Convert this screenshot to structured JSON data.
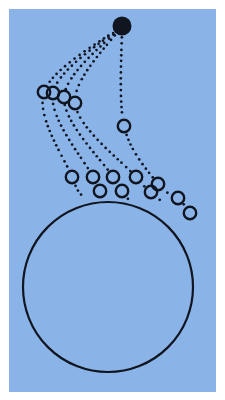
{
  "figure": {
    "type": "diagram",
    "canvas": {
      "width": 225,
      "height": 400
    },
    "background": {
      "page_color": "#ffffff",
      "field_color": "#8ab4e8",
      "field_rect": {
        "x": 9,
        "y": 9,
        "width": 207,
        "height": 383
      }
    },
    "ink_color": "#10151f",
    "launch_point": {
      "label": "launch-point",
      "cx": 122,
      "cy": 26,
      "r": 9.5,
      "fill": "#10151f",
      "filled": true
    },
    "planet": {
      "label": "planet-circle",
      "cx": 108,
      "cy": 287,
      "r": 85,
      "stroke_width": 2.2,
      "fill": "none"
    },
    "marker_style": {
      "r": 6.2,
      "stroke_width": 2.4,
      "fill": "none"
    },
    "dotted_style": {
      "dot_radius": 1.35,
      "spacing": 5.0
    },
    "trajectories": [
      {
        "name": "trajectory-1",
        "description": "shortest range, falls steeply to the left",
        "points": [
          {
            "x": 122,
            "y": 26,
            "marker": false
          },
          {
            "x": 44,
            "y": 92,
            "marker": true
          },
          {
            "x": 72,
            "y": 177,
            "marker": true
          },
          {
            "x": 82,
            "y": 196,
            "marker": false
          }
        ]
      },
      {
        "name": "trajectory-2",
        "description": "second range arc",
        "points": [
          {
            "x": 122,
            "y": 26,
            "marker": false
          },
          {
            "x": 53,
            "y": 93,
            "marker": true
          },
          {
            "x": 93,
            "y": 177,
            "marker": true
          },
          {
            "x": 100,
            "y": 191,
            "marker": true
          },
          {
            "x": 104,
            "y": 199,
            "marker": false
          }
        ]
      },
      {
        "name": "trajectory-3",
        "description": "third range arc",
        "points": [
          {
            "x": 122,
            "y": 26,
            "marker": false
          },
          {
            "x": 64,
            "y": 97,
            "marker": true
          },
          {
            "x": 113,
            "y": 177,
            "marker": true
          },
          {
            "x": 122,
            "y": 191,
            "marker": true
          },
          {
            "x": 128,
            "y": 199,
            "marker": false
          }
        ]
      },
      {
        "name": "trajectory-4",
        "description": "fourth range arc, grazing the surface",
        "points": [
          {
            "x": 122,
            "y": 26,
            "marker": false
          },
          {
            "x": 75,
            "y": 103,
            "marker": true
          },
          {
            "x": 136,
            "y": 177,
            "marker": true
          },
          {
            "x": 151,
            "y": 192,
            "marker": true
          },
          {
            "x": 161,
            "y": 201,
            "marker": false
          }
        ]
      },
      {
        "name": "trajectory-5",
        "description": "longest range, near-vertical descent then orbital grazing",
        "points": [
          {
            "x": 122,
            "y": 26,
            "marker": false
          },
          {
            "x": 124,
            "y": 126,
            "marker": true
          },
          {
            "x": 158,
            "y": 184,
            "marker": true
          },
          {
            "x": 178,
            "y": 198,
            "marker": true
          },
          {
            "x": 190,
            "y": 213,
            "marker": true
          }
        ]
      }
    ],
    "marker_count": 16,
    "ray_count": 5
  }
}
